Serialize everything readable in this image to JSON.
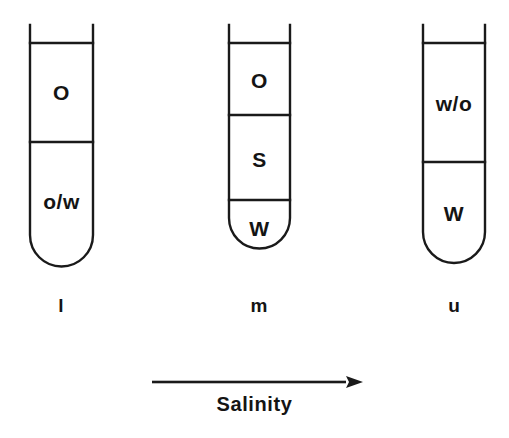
{
  "figure": {
    "type": "phase-behaviour-diagram",
    "stroke_color": "#1a1a1a",
    "background_color": "#ffffff",
    "axis": {
      "label": "Salinity",
      "arrow_direction": "right",
      "arrow_x_start": 152,
      "arrow_x_end": 363,
      "arrow_y": 382
    },
    "tubes": [
      {
        "id": "tube-lower",
        "caption": "l",
        "geometry": {
          "left": 30,
          "right": 93,
          "rim_top": 25,
          "fill_top": 43,
          "body_bottom": 235,
          "bottom": 266,
          "dividers": [
            142
          ]
        },
        "phases": [
          {
            "label": "O",
            "center_y": 92,
            "font_size": 21
          },
          {
            "label": "o/w",
            "center_y": 201,
            "font_size": 21
          }
        ]
      },
      {
        "id": "tube-middle",
        "caption": "m",
        "geometry": {
          "left": 229,
          "right": 290,
          "rim_top": 25,
          "fill_top": 43,
          "body_bottom": 218,
          "bottom": 249,
          "dividers": [
            115,
            200
          ]
        },
        "phases": [
          {
            "label": "O",
            "center_y": 80,
            "font_size": 21
          },
          {
            "label": "S",
            "center_y": 159,
            "font_size": 21
          },
          {
            "label": "W",
            "center_y": 228,
            "font_size": 21
          }
        ]
      },
      {
        "id": "tube-upper",
        "caption": "u",
        "geometry": {
          "left": 423,
          "right": 485,
          "rim_top": 25,
          "fill_top": 43,
          "body_bottom": 232,
          "bottom": 263,
          "dividers": [
            162
          ]
        },
        "phases": [
          {
            "label": "w/o",
            "center_y": 103,
            "font_size": 21
          },
          {
            "label": "W",
            "center_y": 213,
            "font_size": 21
          }
        ]
      }
    ],
    "captions": [
      {
        "label": "l",
        "center_x": 61,
        "top": 296
      },
      {
        "label": "m",
        "center_x": 259,
        "top": 296
      },
      {
        "label": "u",
        "center_x": 454,
        "top": 296
      }
    ]
  }
}
